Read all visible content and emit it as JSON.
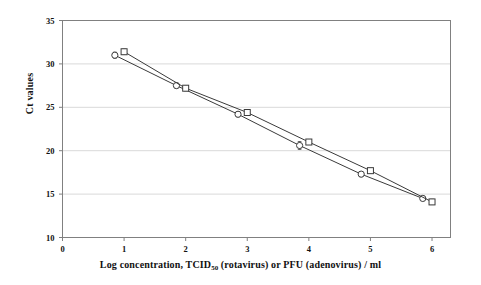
{
  "chart_data": {
    "type": "scatter",
    "title": "",
    "subtitle": "",
    "xlabel_parts": {
      "before": "Log  concentration,  TCID",
      "subscript": "50",
      "after": " (rotavirus)  or  PFU  (adenovirus) / ml"
    },
    "xlabel": "Log concentration, TCID50 (rotavirus) or PFU (adenovirus) / ml",
    "ylabel": "Ct values",
    "xlim": [
      0,
      6.3
    ],
    "ylim": [
      10,
      35
    ],
    "xticks": [
      0,
      1,
      2,
      3,
      4,
      5,
      6
    ],
    "xtick_labels": [
      "0",
      "1",
      "2",
      "3",
      "4",
      "5",
      "6"
    ],
    "yticks": [
      10,
      15,
      20,
      25,
      30,
      35
    ],
    "ytick_labels": [
      "10",
      "15",
      "20",
      "25",
      "30",
      "35"
    ],
    "grid": "horizontal",
    "grid_color": "#d9d9d9",
    "axis_color": "#808080",
    "legend": "none",
    "series": [
      {
        "name": "rotavirus",
        "marker": "circle",
        "color": "#3a3a3a",
        "x": [
          0.85,
          1.85,
          2.85,
          3.85,
          4.85,
          5.85
        ],
        "values": [
          31.0,
          27.5,
          24.2,
          20.6,
          17.3,
          14.5
        ],
        "error": [
          0.35,
          0.3,
          0.3,
          0.45,
          0.3,
          0.25
        ]
      },
      {
        "name": "adenovirus",
        "marker": "square",
        "color": "#3a3a3a",
        "x": [
          1.0,
          2.0,
          3.0,
          4.0,
          5.0,
          6.0
        ],
        "values": [
          31.4,
          27.2,
          24.4,
          21.0,
          17.7,
          14.1
        ],
        "error": [
          0.3,
          0.3,
          0.25,
          0.2,
          0.25,
          0.3
        ]
      }
    ]
  }
}
